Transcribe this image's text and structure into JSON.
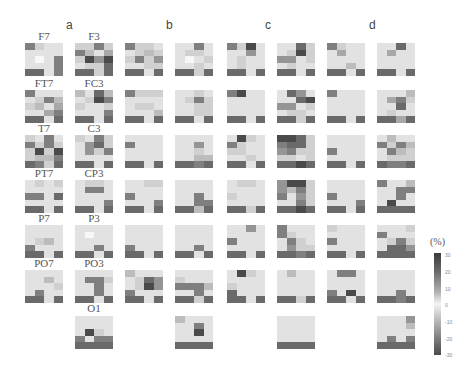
{
  "chart_data": {
    "type": "heatmap",
    "title": "",
    "panels": [
      "a",
      "b",
      "c",
      "d"
    ],
    "channels": [
      "F7",
      "F3",
      "FT7",
      "FC3",
      "T7",
      "C3",
      "PT7",
      "CP3",
      "P7",
      "P3",
      "PO7",
      "PO3",
      "O1"
    ],
    "colorbar": {
      "label": "(%)",
      "ticks": [
        "30",
        "20",
        "10",
        "0",
        "-10",
        "-20",
        "-30"
      ],
      "range": [
        -30,
        30
      ]
    },
    "legend_position": "right",
    "tiles_note": "Each small tile is a 4x5 grid of cells; values are approximate gray intensity (0=white, 9=darkest)",
    "tiles": [
      {
        "id": "a1-F7",
        "col": 0,
        "row": 0,
        "cells": [
          6,
          2,
          1,
          1,
          1,
          1,
          1,
          1,
          1,
          0,
          1,
          6,
          1,
          1,
          1,
          6,
          7,
          7,
          1,
          6
        ]
      },
      {
        "id": "a2-F3",
        "col": 1,
        "row": 0,
        "cells": [
          2,
          2,
          6,
          2,
          6,
          3,
          1,
          4,
          2,
          8,
          5,
          8,
          1,
          2,
          2,
          7,
          7,
          7,
          2,
          7
        ]
      },
      {
        "id": "b1",
        "col": 2,
        "row": 0,
        "cells": [
          6,
          2,
          2,
          1,
          1,
          2,
          3,
          2,
          2,
          6,
          2,
          5,
          1,
          1,
          2,
          2,
          7,
          7,
          1,
          7
        ]
      },
      {
        "id": "b2",
        "col": 3,
        "row": 0,
        "cells": [
          1,
          1,
          6,
          1,
          1,
          2,
          2,
          1,
          1,
          0,
          1,
          2,
          1,
          1,
          2,
          1,
          7,
          7,
          2,
          7
        ]
      },
      {
        "id": "c1",
        "col": 4,
        "row": 0,
        "cells": [
          6,
          2,
          8,
          1,
          1,
          1,
          5,
          1,
          1,
          2,
          1,
          1,
          1,
          2,
          1,
          1,
          7,
          7,
          1,
          7
        ]
      },
      {
        "id": "c2",
        "col": 5,
        "row": 0,
        "cells": [
          1,
          1,
          7,
          2,
          1,
          2,
          8,
          2,
          5,
          5,
          1,
          2,
          1,
          2,
          1,
          1,
          7,
          7,
          1,
          7
        ]
      },
      {
        "id": "d1",
        "col": 6,
        "row": 0,
        "cells": [
          6,
          2,
          1,
          1,
          1,
          4,
          1,
          1,
          1,
          1,
          1,
          1,
          1,
          1,
          3,
          1,
          7,
          7,
          1,
          7
        ]
      },
      {
        "id": "d2",
        "col": 7,
        "row": 0,
        "cells": [
          1,
          1,
          7,
          1,
          1,
          4,
          1,
          1,
          1,
          1,
          1,
          1,
          1,
          1,
          1,
          1,
          7,
          7,
          1,
          7
        ]
      },
      {
        "id": "a1-FT7",
        "col": 0,
        "row": 1,
        "cells": [
          6,
          1,
          1,
          1,
          1,
          2,
          6,
          3,
          2,
          3,
          1,
          4,
          1,
          1,
          4,
          6,
          7,
          7,
          1,
          7
        ]
      },
      {
        "id": "a2-FC3",
        "col": 1,
        "row": 1,
        "cells": [
          3,
          1,
          7,
          3,
          1,
          2,
          8,
          6,
          2,
          1,
          1,
          2,
          1,
          1,
          1,
          6,
          7,
          7,
          1,
          7
        ]
      },
      {
        "id": "b1",
        "col": 2,
        "row": 1,
        "cells": [
          6,
          2,
          2,
          2,
          1,
          1,
          1,
          1,
          1,
          2,
          2,
          1,
          1,
          1,
          1,
          3,
          7,
          7,
          1,
          7
        ]
      },
      {
        "id": "b2",
        "col": 3,
        "row": 1,
        "cells": [
          1,
          1,
          2,
          1,
          1,
          2,
          6,
          2,
          1,
          1,
          2,
          2,
          1,
          1,
          2,
          2,
          7,
          7,
          1,
          7
        ]
      },
      {
        "id": "c1",
        "col": 4,
        "row": 1,
        "cells": [
          6,
          8,
          1,
          1,
          1,
          1,
          1,
          1,
          1,
          1,
          1,
          1,
          1,
          1,
          1,
          1,
          7,
          7,
          1,
          7
        ]
      },
      {
        "id": "c2",
        "col": 5,
        "row": 1,
        "cells": [
          1,
          7,
          5,
          1,
          1,
          1,
          7,
          8,
          5,
          5,
          1,
          2,
          1,
          2,
          2,
          1,
          7,
          7,
          2,
          7
        ]
      },
      {
        "id": "d1",
        "col": 6,
        "row": 1,
        "cells": [
          6,
          1,
          1,
          1,
          1,
          1,
          1,
          1,
          1,
          1,
          1,
          1,
          1,
          1,
          1,
          1,
          7,
          7,
          1,
          7
        ]
      },
      {
        "id": "d2",
        "col": 7,
        "row": 1,
        "cells": [
          1,
          1,
          1,
          3,
          1,
          4,
          6,
          2,
          1,
          1,
          7,
          1,
          1,
          2,
          1,
          1,
          7,
          7,
          4,
          7
        ]
      },
      {
        "id": "a1-T7",
        "col": 0,
        "row": 2,
        "cells": [
          2,
          1,
          6,
          1,
          6,
          2,
          6,
          2,
          2,
          8,
          2,
          8,
          2,
          3,
          3,
          6,
          7,
          6,
          2,
          7
        ]
      },
      {
        "id": "a2-C3",
        "col": 1,
        "row": 2,
        "cells": [
          2,
          1,
          6,
          2,
          1,
          5,
          7,
          2,
          1,
          5,
          2,
          6,
          1,
          1,
          1,
          1,
          7,
          7,
          1,
          7
        ]
      },
      {
        "id": "b1",
        "col": 2,
        "row": 2,
        "cells": [
          1,
          1,
          1,
          1,
          6,
          1,
          1,
          1,
          1,
          1,
          1,
          1,
          1,
          1,
          1,
          1,
          7,
          7,
          1,
          7
        ]
      },
      {
        "id": "b2",
        "col": 3,
        "row": 2,
        "cells": [
          1,
          1,
          1,
          1,
          1,
          1,
          5,
          1,
          1,
          1,
          2,
          1,
          1,
          1,
          3,
          3,
          7,
          7,
          6,
          7
        ]
      },
      {
        "id": "c1",
        "col": 4,
        "row": 2,
        "cells": [
          1,
          8,
          2,
          1,
          6,
          2,
          1,
          1,
          2,
          2,
          1,
          1,
          1,
          1,
          2,
          1,
          7,
          7,
          1,
          7
        ]
      },
      {
        "id": "c2",
        "col": 5,
        "row": 2,
        "cells": [
          8,
          8,
          7,
          2,
          6,
          7,
          7,
          2,
          5,
          6,
          2,
          2,
          2,
          2,
          1,
          2,
          7,
          7,
          8,
          7
        ]
      },
      {
        "id": "d1",
        "col": 6,
        "row": 2,
        "cells": [
          1,
          1,
          1,
          1,
          1,
          1,
          1,
          1,
          6,
          1,
          1,
          1,
          1,
          1,
          1,
          1,
          7,
          7,
          1,
          7
        ]
      },
      {
        "id": "d2",
        "col": 7,
        "row": 2,
        "cells": [
          1,
          3,
          1,
          1,
          6,
          2,
          6,
          3,
          1,
          6,
          3,
          2,
          1,
          2,
          2,
          2,
          7,
          6,
          6,
          7
        ]
      },
      {
        "id": "a1-PT7",
        "col": 0,
        "row": 3,
        "cells": [
          1,
          2,
          1,
          2,
          1,
          1,
          1,
          1,
          6,
          6,
          1,
          7,
          1,
          1,
          1,
          1,
          7,
          7,
          1,
          7
        ]
      },
      {
        "id": "a2-CP3",
        "col": 1,
        "row": 3,
        "cells": [
          1,
          2,
          2,
          1,
          1,
          6,
          6,
          1,
          1,
          1,
          1,
          1,
          1,
          1,
          1,
          6,
          7,
          7,
          1,
          7
        ]
      },
      {
        "id": "b1",
        "col": 2,
        "row": 3,
        "cells": [
          1,
          1,
          2,
          2,
          1,
          1,
          1,
          1,
          6,
          1,
          1,
          1,
          1,
          1,
          1,
          6,
          7,
          7,
          1,
          7
        ]
      },
      {
        "id": "b2",
        "col": 3,
        "row": 3,
        "cells": [
          1,
          1,
          1,
          1,
          1,
          1,
          1,
          1,
          1,
          1,
          6,
          1,
          1,
          1,
          6,
          6,
          7,
          7,
          3,
          7
        ]
      },
      {
        "id": "c1",
        "col": 4,
        "row": 3,
        "cells": [
          1,
          2,
          2,
          1,
          1,
          1,
          1,
          1,
          2,
          1,
          1,
          1,
          1,
          1,
          1,
          1,
          7,
          7,
          2,
          7
        ]
      },
      {
        "id": "c2",
        "col": 5,
        "row": 3,
        "cells": [
          5,
          8,
          8,
          2,
          5,
          3,
          6,
          2,
          6,
          1,
          5,
          2,
          1,
          1,
          6,
          2,
          7,
          7,
          8,
          7
        ]
      },
      {
        "id": "d1",
        "col": 6,
        "row": 3,
        "cells": [
          1,
          1,
          1,
          1,
          1,
          1,
          1,
          1,
          6,
          1,
          1,
          1,
          1,
          1,
          1,
          6,
          7,
          7,
          1,
          7
        ]
      },
      {
        "id": "d2",
        "col": 7,
        "row": 3,
        "cells": [
          6,
          1,
          1,
          3,
          1,
          1,
          6,
          6,
          1,
          1,
          6,
          1,
          1,
          8,
          1,
          1,
          7,
          7,
          7,
          7
        ]
      },
      {
        "id": "a1-P7",
        "col": 0,
        "row": 4,
        "cells": [
          1,
          1,
          1,
          1,
          1,
          1,
          1,
          1,
          1,
          2,
          3,
          1,
          6,
          1,
          1,
          1,
          7,
          7,
          1,
          7
        ]
      },
      {
        "id": "a2-P3",
        "col": 1,
        "row": 4,
        "cells": [
          1,
          1,
          1,
          1,
          1,
          0,
          1,
          1,
          1,
          1,
          1,
          1,
          1,
          1,
          6,
          1,
          7,
          7,
          1,
          7
        ]
      },
      {
        "id": "b1",
        "col": 2,
        "row": 4,
        "cells": [
          1,
          1,
          1,
          1,
          1,
          1,
          1,
          1,
          1,
          1,
          1,
          1,
          6,
          1,
          1,
          1,
          7,
          7,
          1,
          7
        ]
      },
      {
        "id": "b2",
        "col": 3,
        "row": 4,
        "cells": [
          1,
          1,
          1,
          1,
          1,
          1,
          1,
          1,
          1,
          1,
          1,
          1,
          1,
          1,
          6,
          1,
          7,
          7,
          1,
          7
        ]
      },
      {
        "id": "c1",
        "col": 4,
        "row": 4,
        "cells": [
          1,
          1,
          5,
          1,
          1,
          1,
          1,
          1,
          6,
          1,
          1,
          1,
          1,
          1,
          1,
          1,
          7,
          7,
          1,
          7
        ]
      },
      {
        "id": "c2",
        "col": 5,
        "row": 4,
        "cells": [
          6,
          1,
          1,
          1,
          6,
          2,
          1,
          1,
          1,
          6,
          2,
          1,
          1,
          5,
          2,
          2,
          7,
          7,
          6,
          7
        ]
      },
      {
        "id": "d1",
        "col": 6,
        "row": 4,
        "cells": [
          2,
          1,
          1,
          1,
          1,
          1,
          1,
          1,
          6,
          1,
          1,
          1,
          1,
          1,
          1,
          1,
          7,
          7,
          1,
          7
        ]
      },
      {
        "id": "d2",
        "col": 7,
        "row": 4,
        "cells": [
          1,
          1,
          1,
          2,
          6,
          1,
          1,
          1,
          1,
          2,
          6,
          2,
          1,
          7,
          7,
          5,
          7,
          7,
          7,
          7
        ]
      },
      {
        "id": "a1-PO7",
        "col": 0,
        "row": 5,
        "cells": [
          1,
          1,
          1,
          1,
          1,
          1,
          3,
          1,
          1,
          1,
          1,
          2,
          1,
          6,
          1,
          1,
          7,
          7,
          1,
          7
        ]
      },
      {
        "id": "a2-PO3",
        "col": 1,
        "row": 5,
        "cells": [
          1,
          1,
          1,
          1,
          1,
          6,
          6,
          2,
          1,
          1,
          6,
          1,
          1,
          1,
          6,
          1,
          7,
          7,
          1,
          7
        ]
      },
      {
        "id": "b1",
        "col": 2,
        "row": 5,
        "cells": [
          3,
          1,
          1,
          1,
          1,
          2,
          7,
          5,
          1,
          2,
          8,
          5,
          6,
          1,
          1,
          1,
          7,
          7,
          1,
          7
        ]
      },
      {
        "id": "b2",
        "col": 3,
        "row": 5,
        "cells": [
          1,
          1,
          1,
          1,
          2,
          1,
          1,
          1,
          6,
          6,
          6,
          3,
          1,
          1,
          6,
          1,
          7,
          7,
          2,
          7
        ]
      },
      {
        "id": "c1",
        "col": 4,
        "row": 5,
        "cells": [
          1,
          8,
          2,
          1,
          1,
          1,
          1,
          1,
          2,
          1,
          1,
          1,
          7,
          1,
          1,
          1,
          7,
          7,
          1,
          7
        ]
      },
      {
        "id": "c2",
        "col": 5,
        "row": 5,
        "cells": [
          1,
          3,
          1,
          1,
          1,
          1,
          1,
          1,
          1,
          1,
          1,
          1,
          1,
          1,
          1,
          1,
          7,
          7,
          2,
          7
        ]
      },
      {
        "id": "d1",
        "col": 6,
        "row": 5,
        "cells": [
          1,
          6,
          6,
          1,
          1,
          1,
          1,
          1,
          1,
          1,
          1,
          1,
          6,
          1,
          8,
          1,
          7,
          7,
          1,
          7
        ]
      },
      {
        "id": "d2",
        "col": 7,
        "row": 5,
        "cells": [
          1,
          1,
          1,
          1,
          1,
          1,
          1,
          1,
          1,
          1,
          1,
          1,
          1,
          1,
          6,
          1,
          7,
          7,
          6,
          7
        ]
      },
      {
        "id": "a2-O1",
        "col": 1,
        "row": 6,
        "cells": [
          1,
          1,
          1,
          1,
          1,
          1,
          1,
          1,
          1,
          8,
          2,
          1,
          6,
          1,
          6,
          6,
          7,
          7,
          7,
          7
        ]
      },
      {
        "id": "b2",
        "col": 3,
        "row": 6,
        "cells": [
          3,
          1,
          1,
          1,
          1,
          1,
          6,
          1,
          1,
          1,
          8,
          1,
          1,
          1,
          1,
          1,
          7,
          7,
          7,
          7
        ]
      },
      {
        "id": "c2",
        "col": 5,
        "row": 6,
        "cells": [
          1,
          1,
          1,
          1,
          1,
          1,
          1,
          1,
          1,
          1,
          1,
          1,
          1,
          1,
          1,
          1,
          7,
          7,
          7,
          7
        ]
      },
      {
        "id": "d2",
        "col": 7,
        "row": 6,
        "cells": [
          1,
          1,
          1,
          5,
          1,
          1,
          1,
          3,
          1,
          1,
          1,
          1,
          1,
          6,
          1,
          6,
          7,
          7,
          7,
          7
        ]
      }
    ]
  },
  "panels": {
    "a": "a",
    "b": "b",
    "c": "c",
    "d": "d"
  },
  "channel_labels": {
    "F7": "F7",
    "F3": "F3",
    "FT7": "FT7",
    "FC3": "FC3",
    "T7": "T7",
    "C3": "C3",
    "PT7": "PT7",
    "CP3": "CP3",
    "P7": "P7",
    "P3": "P3",
    "PO7": "PO7",
    "PO3": "PO3",
    "O1": "O1"
  },
  "colorbar": {
    "unit": "(%)",
    "ticks": [
      "30",
      "20",
      "10",
      "0",
      "-10",
      "-20",
      "-30"
    ]
  }
}
